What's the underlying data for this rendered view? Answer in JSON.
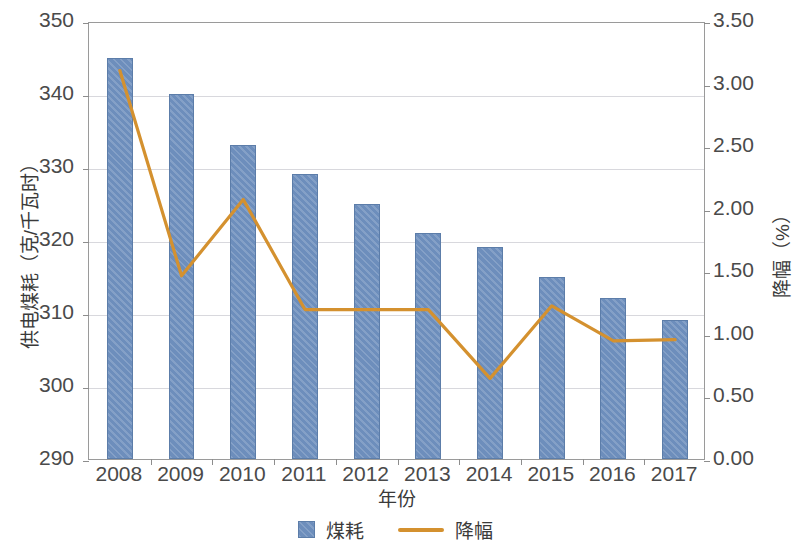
{
  "chart_data": {
    "type": "bar",
    "title": "",
    "subtitle": "",
    "xlabel": "年份",
    "ylabel": "供电煤耗（克/千瓦时）",
    "y2label": "降幅（%）",
    "categories": [
      "2008",
      "2009",
      "2010",
      "2011",
      "2012",
      "2013",
      "2014",
      "2015",
      "2016",
      "2017"
    ],
    "ylim": [
      290,
      350
    ],
    "y2lim": [
      0.0,
      3.5
    ],
    "yticks": [
      "290",
      "300",
      "310",
      "320",
      "330",
      "340",
      "350"
    ],
    "ytick_values": [
      290,
      300,
      310,
      320,
      330,
      340,
      350
    ],
    "y2ticks": [
      "0.00",
      "0.50",
      "1.00",
      "1.50",
      "2.00",
      "2.50",
      "3.00",
      "3.50"
    ],
    "y2tick_values": [
      0.0,
      0.5,
      1.0,
      1.5,
      2.0,
      2.5,
      3.0,
      3.5
    ],
    "grid": true,
    "legend_position": "bottom",
    "series": [
      {
        "name": "煤耗",
        "kind": "bar",
        "axis": "left",
        "color": "#6d8ebc",
        "values": [
          345,
          340,
          333,
          329,
          325,
          321,
          319,
          315,
          312,
          309
        ]
      },
      {
        "name": "降幅",
        "kind": "line",
        "axis": "right",
        "color": "#d4912f",
        "values": [
          3.12,
          1.48,
          2.09,
          1.21,
          1.21,
          1.21,
          0.66,
          1.24,
          0.96,
          0.97
        ]
      }
    ]
  },
  "legend": {
    "items": [
      {
        "label": "煤耗",
        "marker": "square-swatch"
      },
      {
        "label": "降幅",
        "marker": "line-swatch"
      }
    ]
  },
  "colors": {
    "bar": "#6d8ebc",
    "bar_border": "#5c7da9",
    "line": "#d4912f",
    "grid": "#d8d8dd",
    "axis": "#9a9a9a",
    "text": "#3a3a3a",
    "background": "#ffffff"
  }
}
